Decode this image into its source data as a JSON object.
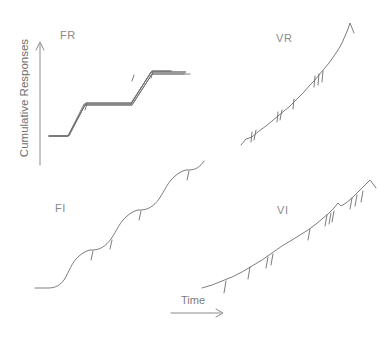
{
  "figure": {
    "background_color": "#ffffff",
    "line_color": "#6e6e6e",
    "axis_color": "#8c8c8c",
    "text_color": "#7c7c7c"
  },
  "axes": {
    "y_label": "Cumulative Responses",
    "x_label": "Time",
    "y_arrow_icon": "arrow-up-icon",
    "x_arrow_icon": "arrow-right-icon"
  },
  "panels": [
    {
      "id": "fr",
      "label": "FR",
      "name": "Fixed Ratio",
      "position": "top-left",
      "pattern": "step",
      "description": "Break-and-run: post-reinforcement pause followed by a steep constant-rate run, producing a staircase."
    },
    {
      "id": "vr",
      "label": "VR",
      "name": "Variable Ratio",
      "position": "top-right",
      "pattern": "steep-steady",
      "description": "High steady rate with no post-reinforcement pausing; reinforcement hatch marks scattered along the line."
    },
    {
      "id": "fi",
      "label": "FI",
      "name": "Fixed Interval",
      "position": "bottom-left",
      "pattern": "scallop",
      "description": "Fixed-interval scallop: pause after reinforcement then accelerating responding up to the next reinforcer."
    },
    {
      "id": "vi",
      "label": "VI",
      "name": "Variable Interval",
      "position": "bottom-right",
      "pattern": "moderate-steady",
      "description": "Moderate steady rate, shallower slope than VR, with irregularly spaced reinforcement hatch marks."
    }
  ],
  "credit": ""
}
